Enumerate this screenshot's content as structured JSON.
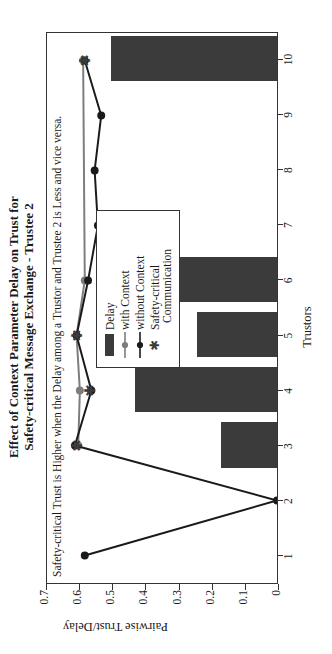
{
  "title": {
    "line1": "Effect of Context Parameter Delay on Trust for",
    "line2": "Safety-critical Message Exchange - Trustee 2"
  },
  "annotation": "Safety-critical Trust is Higher when the Delay among a Trustor and Trustee 2 is Less and vice versa.",
  "legend": {
    "items": [
      {
        "label": "Delay",
        "key": "bar-swatch"
      },
      {
        "label": "with Context",
        "key": "gray-line-circle"
      },
      {
        "label": "without Context",
        "key": "black-line-circle"
      },
      {
        "label": "Safety-critical",
        "label2": "Communication",
        "key": "star-marker"
      }
    ]
  },
  "colors": {
    "bar": "#3b3b3b",
    "with_context": "#7d7d7d",
    "without_context": "#1a1a1a",
    "axis": "#333333"
  },
  "chart_data": {
    "type": "bar",
    "title": "Effect of Context Parameter Delay on Trust for Safety-critical Message Exchange - Trustee 2",
    "xlabel": "Trustors",
    "ylabel": "Pairwise Trust/Delay",
    "x": [
      1,
      2,
      3,
      4,
      5,
      6,
      7,
      8,
      9,
      10
    ],
    "xtick_labels": [
      "1",
      "2",
      "3",
      "4",
      "5",
      "6",
      "7",
      "8",
      "9",
      "10"
    ],
    "ytick_labels": [
      "0",
      "0.1",
      "0.2",
      "0.3",
      "0.4",
      "0.5",
      "0.6",
      "0.7"
    ],
    "ytick_values": [
      0,
      0.1,
      0.2,
      0.3,
      0.4,
      0.5,
      0.6,
      0.7
    ],
    "ylim": [
      0,
      0.7
    ],
    "grid": false,
    "legend_position": "inside-upper-right",
    "series": [
      {
        "name": "Delay",
        "type": "bar",
        "color": "#3b3b3b",
        "values": [
          0,
          0,
          0.17,
          0.43,
          0.24,
          0.52,
          0,
          0,
          0,
          0.5
        ]
      },
      {
        "name": "with Context",
        "type": "line",
        "color": "#7d7d7d",
        "marker": "circle",
        "values": [
          null,
          null,
          0.605,
          0.6,
          0.61,
          0.585,
          null,
          null,
          null,
          0.59
        ]
      },
      {
        "name": "without Context",
        "type": "line",
        "color": "#1a1a1a",
        "marker": "circle",
        "values": [
          0.585,
          0.0,
          0.615,
          0.565,
          0.61,
          0.575,
          0.545,
          0.555,
          0.535,
          0.585
        ]
      },
      {
        "name": "Safety-critical Communication",
        "type": "marker",
        "color": "#3b3b3b",
        "marker": "star",
        "values": [
          null,
          null,
          0.61,
          0.57,
          0.61,
          null,
          null,
          null,
          null,
          0.585
        ]
      }
    ]
  }
}
